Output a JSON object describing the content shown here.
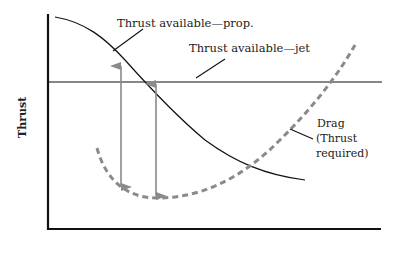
{
  "diagram": {
    "type": "thrust-drag-curves",
    "y_axis_label": "Thrust",
    "x_axis_label": "",
    "labels": {
      "prop": "Thrust available—prop.",
      "jet": "Thrust available—jet",
      "drag_line1": "Drag",
      "drag_line2": "(Thrust",
      "drag_line3": "required)"
    },
    "colors": {
      "axis": "#111111",
      "curve": "#111111",
      "drag": "#8a8a8a",
      "arrow": "#8a8a8a"
    },
    "curves": [
      {
        "name": "Thrust available - prop",
        "style": "solid",
        "shape": "decreasing"
      },
      {
        "name": "Thrust available - jet",
        "style": "solid",
        "shape": "constant"
      },
      {
        "name": "Drag (Thrust required)",
        "style": "dashed",
        "shape": "U-shaped"
      }
    ],
    "arrows": [
      {
        "name": "excess thrust - prop",
        "direction": "double"
      },
      {
        "name": "excess thrust - jet",
        "direction": "double"
      }
    ]
  }
}
